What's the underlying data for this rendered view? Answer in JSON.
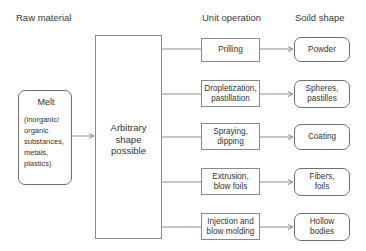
{
  "headers": {
    "raw_material": "Raw material",
    "unit_operation": "Unit operation",
    "solid_shape": "Soild shape"
  },
  "melt": {
    "title": "Melt",
    "detail": "(inorganic/\norganic\nsubstances,\nmetals,\nplastics)"
  },
  "arbitrary": {
    "label": "Arbitrary\nshape\npossible"
  },
  "rows": [
    {
      "operation": "Prilling",
      "shape": "Powder"
    },
    {
      "operation": "Dropletization,\npastillation",
      "shape": "Spheres,\npastilles"
    },
    {
      "operation": "Spraying,\ndipping",
      "shape": "Coating"
    },
    {
      "operation": "Extrusion,\nblow foils",
      "shape": "Fibers,\nfoils"
    },
    {
      "operation": "Injection and\nblow molding",
      "shape": "Hollow\nbodies"
    }
  ],
  "colors": {
    "line": "#8c8c8c",
    "box_border": "#8a8a8a",
    "rounded_border": "#6e6e6e",
    "text": "#333333"
  }
}
